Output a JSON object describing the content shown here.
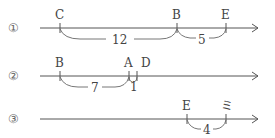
{
  "rows": [
    {
      "index_label": "①",
      "points": [
        {
          "name": "C",
          "x": 60
        },
        {
          "name": "B",
          "x": 177
        },
        {
          "name": "E",
          "x": 226
        }
      ],
      "spans": [
        {
          "from": "C",
          "to": "B",
          "value": "12"
        },
        {
          "from": "B",
          "to": "E",
          "value": "5"
        }
      ]
    },
    {
      "index_label": "②",
      "points": [
        {
          "name": "B",
          "x": 60
        },
        {
          "name": "A",
          "x": 129
        },
        {
          "name": "D",
          "x": 137
        }
      ],
      "spans": [
        {
          "from": "B",
          "to": "A",
          "value": "7"
        },
        {
          "from": "A",
          "to": "D",
          "value": "1"
        }
      ]
    },
    {
      "index_label": "③",
      "points": [
        {
          "name": "E",
          "x": 187
        },
        {
          "name": "ミ",
          "x": 226
        }
      ],
      "spans": [
        {
          "from": "E",
          "to": "ミ",
          "value": "4"
        }
      ]
    }
  ]
}
